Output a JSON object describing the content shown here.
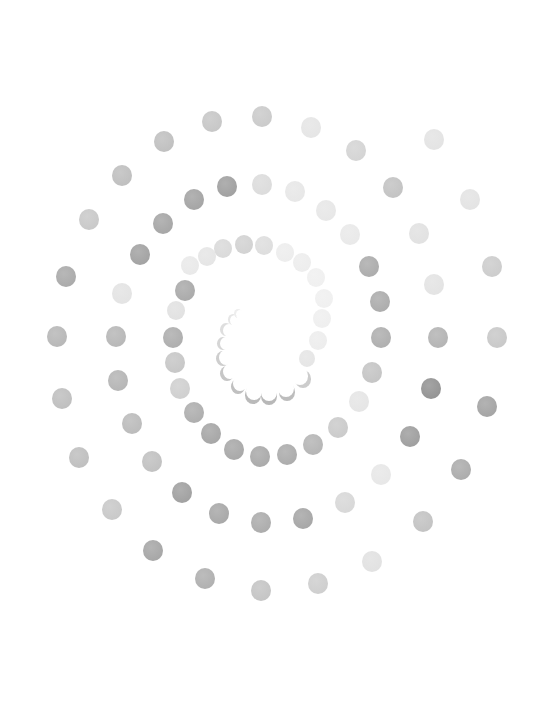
{
  "artwork": {
    "description": "Spiral of watercolor dots in shades of gray on white",
    "background": "#ffffff",
    "dots": [
      {
        "x": 262,
        "y": 116,
        "r": 10,
        "c": "#c8c8c8"
      },
      {
        "x": 212,
        "y": 121,
        "r": 10,
        "c": "#c4c4c4"
      },
      {
        "x": 311,
        "y": 127,
        "r": 10,
        "c": "#e4e4e4"
      },
      {
        "x": 164,
        "y": 141,
        "r": 10,
        "c": "#bdbdbd"
      },
      {
        "x": 356,
        "y": 150,
        "r": 10,
        "c": "#d2d2d2"
      },
      {
        "x": 434,
        "y": 139,
        "r": 10,
        "c": "#e2e2e2"
      },
      {
        "x": 122,
        "y": 175,
        "r": 10,
        "c": "#bcbcbc"
      },
      {
        "x": 227,
        "y": 186,
        "r": 10,
        "c": "#9c9c9c"
      },
      {
        "x": 262,
        "y": 184,
        "r": 10,
        "c": "#dadada"
      },
      {
        "x": 194,
        "y": 199,
        "r": 10,
        "c": "#a0a0a0"
      },
      {
        "x": 295,
        "y": 191,
        "r": 10,
        "c": "#e6e6e6"
      },
      {
        "x": 393,
        "y": 187,
        "r": 10,
        "c": "#c0c0c0"
      },
      {
        "x": 470,
        "y": 199,
        "r": 10,
        "c": "#e2e2e2"
      },
      {
        "x": 89,
        "y": 219,
        "r": 10,
        "c": "#c6c6c6"
      },
      {
        "x": 163,
        "y": 223,
        "r": 10,
        "c": "#a2a2a2"
      },
      {
        "x": 326,
        "y": 210,
        "r": 10,
        "c": "#e6e6e6"
      },
      {
        "x": 350,
        "y": 234,
        "r": 10,
        "c": "#e8e8e8"
      },
      {
        "x": 419,
        "y": 233,
        "r": 10,
        "c": "#e0e0e0"
      },
      {
        "x": 140,
        "y": 254,
        "r": 10,
        "c": "#9e9e9e"
      },
      {
        "x": 369,
        "y": 266,
        "r": 10,
        "c": "#a8a8a8"
      },
      {
        "x": 492,
        "y": 266,
        "r": 10,
        "c": "#cacaca"
      },
      {
        "x": 66,
        "y": 276,
        "r": 10,
        "c": "#a6a6a6"
      },
      {
        "x": 122,
        "y": 293,
        "r": 10,
        "c": "#e2e2e2"
      },
      {
        "x": 380,
        "y": 301,
        "r": 10,
        "c": "#a8a8a8"
      },
      {
        "x": 434,
        "y": 284,
        "r": 10,
        "c": "#e2e2e2"
      },
      {
        "x": 57,
        "y": 336,
        "r": 10,
        "c": "#b4b4b4"
      },
      {
        "x": 116,
        "y": 336,
        "r": 10,
        "c": "#b4b4b4"
      },
      {
        "x": 381,
        "y": 337,
        "r": 10,
        "c": "#ababab"
      },
      {
        "x": 438,
        "y": 337,
        "r": 10,
        "c": "#b0b0b0"
      },
      {
        "x": 497,
        "y": 337,
        "r": 10,
        "c": "#c6c6c6"
      },
      {
        "x": 118,
        "y": 380,
        "r": 10,
        "c": "#b2b2b2"
      },
      {
        "x": 372,
        "y": 372,
        "r": 10,
        "c": "#c2c2c2"
      },
      {
        "x": 431,
        "y": 388,
        "r": 10,
        "c": "#8e8e8e"
      },
      {
        "x": 62,
        "y": 398,
        "r": 10,
        "c": "#bcbcbc"
      },
      {
        "x": 487,
        "y": 406,
        "r": 10,
        "c": "#a0a0a0"
      },
      {
        "x": 132,
        "y": 423,
        "r": 10,
        "c": "#b8b8b8"
      },
      {
        "x": 359,
        "y": 401,
        "r": 10,
        "c": "#e4e4e4"
      },
      {
        "x": 338,
        "y": 427,
        "r": 10,
        "c": "#c8c8c8"
      },
      {
        "x": 410,
        "y": 436,
        "r": 10,
        "c": "#9a9a9a"
      },
      {
        "x": 313,
        "y": 444,
        "r": 10,
        "c": "#b2b2b2"
      },
      {
        "x": 287,
        "y": 454,
        "r": 10,
        "c": "#a8a8a8"
      },
      {
        "x": 260,
        "y": 456,
        "r": 10,
        "c": "#a6a6a6"
      },
      {
        "x": 234,
        "y": 449,
        "r": 10,
        "c": "#a4a4a4"
      },
      {
        "x": 211,
        "y": 433,
        "r": 10,
        "c": "#a2a2a2"
      },
      {
        "x": 194,
        "y": 412,
        "r": 10,
        "c": "#aaaaaa"
      },
      {
        "x": 79,
        "y": 457,
        "r": 10,
        "c": "#bcbcbc"
      },
      {
        "x": 152,
        "y": 461,
        "r": 10,
        "c": "#bebebe"
      },
      {
        "x": 461,
        "y": 469,
        "r": 10,
        "c": "#a8a8a8"
      },
      {
        "x": 381,
        "y": 474,
        "r": 10,
        "c": "#e6e6e6"
      },
      {
        "x": 182,
        "y": 492,
        "r": 10,
        "c": "#9c9c9c"
      },
      {
        "x": 345,
        "y": 502,
        "r": 10,
        "c": "#d6d6d6"
      },
      {
        "x": 112,
        "y": 509,
        "r": 10,
        "c": "#c6c6c6"
      },
      {
        "x": 219,
        "y": 513,
        "r": 10,
        "c": "#a4a4a4"
      },
      {
        "x": 303,
        "y": 518,
        "r": 10,
        "c": "#a2a2a2"
      },
      {
        "x": 261,
        "y": 522,
        "r": 10,
        "c": "#a8a8a8"
      },
      {
        "x": 423,
        "y": 521,
        "r": 10,
        "c": "#c0c0c0"
      },
      {
        "x": 153,
        "y": 550,
        "r": 10,
        "c": "#a2a2a2"
      },
      {
        "x": 372,
        "y": 561,
        "r": 10,
        "c": "#e0e0e0"
      },
      {
        "x": 205,
        "y": 578,
        "r": 10,
        "c": "#acacac"
      },
      {
        "x": 318,
        "y": 583,
        "r": 10,
        "c": "#cccccc"
      },
      {
        "x": 261,
        "y": 590,
        "r": 10,
        "c": "#c2c2c2"
      },
      {
        "x": 185,
        "y": 290,
        "r": 10,
        "c": "#a6a6a6"
      },
      {
        "x": 176,
        "y": 310,
        "r": 9,
        "c": "#e0e0e0"
      },
      {
        "x": 173,
        "y": 337,
        "r": 10,
        "c": "#aaaaaa"
      },
      {
        "x": 175,
        "y": 362,
        "r": 10,
        "c": "#c4c4c4"
      },
      {
        "x": 180,
        "y": 388,
        "r": 10,
        "c": "#cdcdcd"
      },
      {
        "x": 190,
        "y": 265,
        "r": 9,
        "c": "#e8e8e8"
      },
      {
        "x": 207,
        "y": 256,
        "r": 9,
        "c": "#e4e4e4"
      },
      {
        "x": 223,
        "y": 248,
        "r": 9,
        "c": "#d8d8d8"
      },
      {
        "x": 244,
        "y": 244,
        "r": 9,
        "c": "#d0d0d0"
      },
      {
        "x": 264,
        "y": 245,
        "r": 9,
        "c": "#dcdcdc"
      },
      {
        "x": 285,
        "y": 252,
        "r": 9,
        "c": "#ececec"
      },
      {
        "x": 302,
        "y": 262,
        "r": 9,
        "c": "#ececec"
      },
      {
        "x": 316,
        "y": 277,
        "r": 9,
        "c": "#efefef"
      },
      {
        "x": 324,
        "y": 298,
        "r": 9,
        "c": "#efefef"
      },
      {
        "x": 322,
        "y": 318,
        "r": 9,
        "c": "#eeeeee"
      },
      {
        "x": 318,
        "y": 340,
        "r": 9,
        "c": "#ececec"
      },
      {
        "x": 307,
        "y": 358,
        "r": 8,
        "c": "#e4e4e4"
      }
    ],
    "crescents": [
      {
        "x": 300,
        "y": 375,
        "r": 8,
        "c": "#cccccc"
      },
      {
        "x": 286,
        "y": 387,
        "r": 8,
        "c": "#bdbdbd"
      },
      {
        "x": 269,
        "y": 391,
        "r": 8,
        "c": "#b8b8b8"
      },
      {
        "x": 254,
        "y": 390,
        "r": 8,
        "c": "#bababa"
      },
      {
        "x": 240,
        "y": 383,
        "r": 7,
        "c": "#c0c0c0"
      },
      {
        "x": 230,
        "y": 371,
        "r": 7,
        "c": "#c6c6c6"
      },
      {
        "x": 226,
        "y": 357,
        "r": 7,
        "c": "#cecece"
      },
      {
        "x": 226,
        "y": 343,
        "r": 6,
        "c": "#d6d6d6"
      },
      {
        "x": 229,
        "y": 330,
        "r": 6,
        "c": "#dedede"
      },
      {
        "x": 235,
        "y": 320,
        "r": 5,
        "c": "#e6e6e6"
      },
      {
        "x": 240,
        "y": 314,
        "r": 4,
        "c": "#eeeeee"
      }
    ]
  }
}
